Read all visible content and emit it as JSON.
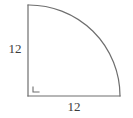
{
  "figure": {
    "shape_name": "quarter-circle",
    "background_color": "#ffffff",
    "stroke_color": "#6e6e6e",
    "stroke_width": 1.2,
    "text_color": "#3c3c3c",
    "geometry": {
      "center_x": 28,
      "center_y": 96,
      "radius_px": 92,
      "arc_start_x": 28,
      "arc_start_y": 5,
      "arc_end_x": 120,
      "arc_end_y": 96,
      "vertical_leg": {
        "x1": 28,
        "y1": 5,
        "x2": 28,
        "y2": 96
      },
      "horizontal_leg": {
        "x1": 28,
        "y1": 96,
        "x2": 120,
        "y2": 96
      },
      "right_angle_marker": {
        "x1": 33,
        "y1": 87,
        "x2": 33,
        "y2": 92,
        "x3": 39,
        "y3": 92
      }
    },
    "labels": {
      "vertical_radius": "12",
      "horizontal_radius": "12"
    }
  }
}
